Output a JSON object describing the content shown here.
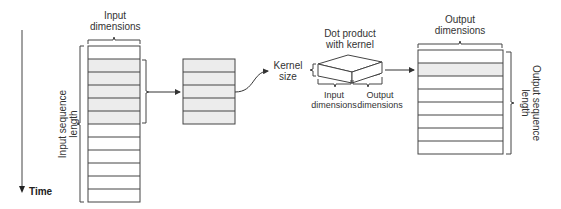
{
  "labels": {
    "input_dimensions": [
      "Input",
      "dimensions"
    ],
    "input_sequence_length": [
      "Input sequence",
      "length"
    ],
    "time": "Time",
    "kernel_size": [
      "Kernel",
      "size"
    ],
    "dot_product": [
      "Dot product",
      "with kernel"
    ],
    "kernel_input_dimensions": [
      "Input",
      "dimensions"
    ],
    "kernel_output_dimensions": [
      "Output",
      "dimensions"
    ],
    "output_dimensions": [
      "Output",
      "dimensions"
    ],
    "output_sequence_length": [
      "Output sequence",
      "length"
    ]
  },
  "input_grid": {
    "rows": 12,
    "shaded_rows": [
      1,
      2,
      3,
      4,
      5
    ]
  },
  "window_grid": {
    "rows": 5
  },
  "output_grid": {
    "rows": 8,
    "shaded_rows": [
      1
    ]
  },
  "colors": {
    "line": "#333333",
    "shade": "#ececec"
  }
}
